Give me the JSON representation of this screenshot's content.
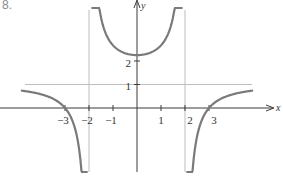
{
  "problem_number": "8.",
  "chart_data": {
    "type": "line",
    "title": "",
    "xlabel": "x",
    "ylabel": "y",
    "function": "y = (x^2 - 9)/(x^2 - 4)",
    "x_ticks": [
      -3,
      -2,
      -1,
      1,
      2,
      3
    ],
    "x_tick_labels": [
      "−3",
      "−2",
      "−1",
      "1",
      "2",
      "3"
    ],
    "y_ticks": [
      1,
      2
    ],
    "y_tick_labels": [
      "1",
      "2"
    ],
    "vertical_asymptotes": [
      -2,
      2
    ],
    "horizontal_asymptote": 1,
    "x_intercepts": [
      -3,
      3
    ],
    "y_intercept": 2,
    "xlim": [
      -5.3,
      6
    ],
    "ylim": [
      -2.9,
      4.6
    ],
    "grid": false,
    "legend": null,
    "series": [
      {
        "name": "left branch",
        "x": [
          -3.2,
          -3,
          -2.5,
          -2.2,
          -2.08
        ],
        "y": [
          0.54,
          0,
          -1.22,
          -3.4,
          -4.0
        ]
      },
      {
        "name": "middle branch",
        "x": [
          -1.85,
          -1.5,
          -1,
          0,
          1,
          1.5,
          1.85
        ],
        "y": [
          4.6,
          3.9,
          2.67,
          2.25,
          2.67,
          3.9,
          4.6
        ]
      },
      {
        "name": "right branch",
        "x": [
          2.08,
          2.2,
          2.5,
          3,
          4.0
        ],
        "y": [
          -4.0,
          -3.4,
          -1.22,
          0,
          0.58
        ]
      }
    ],
    "colors": {
      "curve": "#7a7a7a",
      "axes": "#3a3a3a",
      "asymptote": "#bdbdbd",
      "text": "#333333"
    }
  }
}
